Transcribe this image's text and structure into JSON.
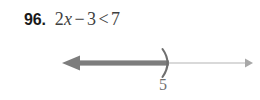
{
  "exercise": {
    "number": "96.",
    "inequality": {
      "full_text": "2x − 3 < 7",
      "coefficient_term": "2",
      "variable": "x",
      "minus_operator": "−",
      "constant": "3",
      "relation": "<",
      "right_side": "7"
    }
  },
  "number_line": {
    "endpoint_label": "5",
    "endpoint_bracket": ")",
    "endpoint_type": "open",
    "shaded_direction": "left",
    "left_arrow": "left-arrowhead",
    "right_arrow": "right-arrowhead",
    "colors": {
      "shaded_ray": "#7d7d7d",
      "axis_line": "#b4b4b4",
      "bracket": "#6f6f6f",
      "label": "#6f6f6f"
    }
  },
  "page": {
    "background": "#ffffff"
  }
}
